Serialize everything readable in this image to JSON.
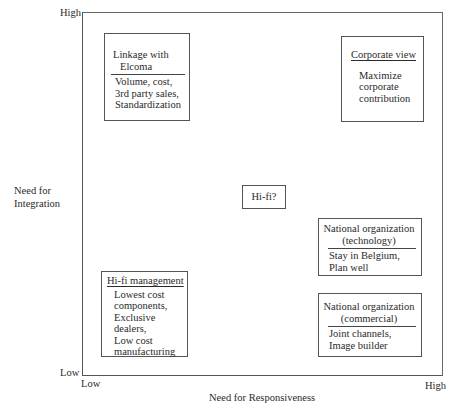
{
  "axes": {
    "y_title": [
      "Need for",
      "Integration"
    ],
    "y_high": "High",
    "y_low": "Low",
    "x_title": "Need for Responsiveness",
    "x_low": "Low",
    "x_high": "High"
  },
  "boxes": {
    "elcoma": {
      "title": [
        "Linkage with",
        "Elcoma"
      ],
      "items": [
        "Volume, cost,",
        "3rd party sales,",
        "Standardization"
      ]
    },
    "corporate": {
      "title": "Corporate view",
      "items": [
        "Maximize",
        "corporate",
        "contribution"
      ]
    },
    "hifi": {
      "title": "Hi-fi?"
    },
    "nat_tech": {
      "title": [
        "National organization",
        "(technology)"
      ],
      "items": [
        "Stay in Belgium,",
        "Plan well"
      ]
    },
    "hifi_mgmt": {
      "title": "Hi-fi management",
      "items": [
        "Lowest cost",
        "components,",
        "Exclusive",
        "dealers,",
        "Low cost",
        "manufacturing"
      ]
    },
    "nat_comm": {
      "title": [
        "National organization",
        "(commercial)"
      ],
      "items": [
        "Joint channels,",
        "Image builder"
      ]
    }
  }
}
